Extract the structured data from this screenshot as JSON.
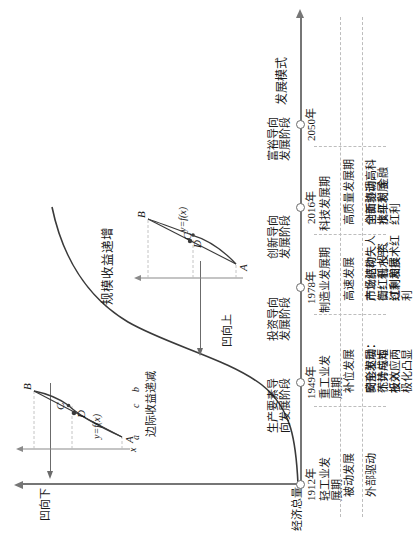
{
  "figure": {
    "y_axis_label": "经济总量",
    "x_axis_label": "发展模式",
    "curve_annotations": {
      "increasing_returns": "规模收益递增",
      "concave_down": "凹向下",
      "concave_up": "凹向上"
    }
  },
  "insets": {
    "left": {
      "function_label": "y=f(x)",
      "caption": "边际收益递减",
      "points": [
        "A",
        "B",
        "C",
        "D"
      ],
      "axis_ticks": [
        "a",
        "c",
        "b"
      ],
      "axis_name": "x"
    },
    "right": {
      "function_label": "y=f(x)",
      "points": [
        "A",
        "B",
        "C",
        "D"
      ]
    }
  },
  "timeline": {
    "milestones": [
      {
        "year": "1912年",
        "label": "轻工业发\n展期"
      },
      {
        "year": "1949年",
        "label": "重工业发\n展期"
      },
      {
        "year": "1978年",
        "label": "制造业发展期"
      },
      {
        "year": "2016年",
        "label": "科技发展期"
      },
      {
        "year": "2050年",
        "label": ""
      }
    ],
    "stages": [
      {
        "name": "生产要素导\n向发展阶段"
      },
      {
        "name": "投资导向\n发展阶段"
      },
      {
        "name": "创新导向\n发展阶段"
      },
      {
        "name": "富裕导向\n发展阶段"
      }
    ]
  },
  "table": {
    "rows": [
      {
        "name": "发展特征",
        "cells": [
          "被动发展",
          "补位发展",
          "高速发展",
          "高质量发展期"
        ]
      },
      {
        "name": "驱动因素",
        "cells": [
          "外部驱动",
          "安全驱动：\n不计成本\n投入",
          "市场驱动：人\n口红利 投资\n红利和技术红\n利",
          "创新驱动：科\n技红利 金融\n红利"
        ]
      },
      {
        "name": "结果",
        "cells": [
          "",
          "畸形发展：\n优势与短\n板效应两\n极化凸显",
          "产业结构失\n衡：低水平、\n过剩发展",
          "全面协调高\n水平发展"
        ]
      }
    ]
  },
  "colors": {
    "axis": "#767676",
    "curve": "#3a3a3a",
    "grid": "#bdbdbd",
    "text": "#1a1a1a"
  }
}
